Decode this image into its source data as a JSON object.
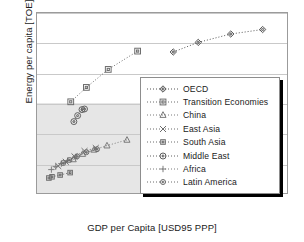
{
  "chart_data": {
    "type": "scatter",
    "title": "",
    "xlabel": "GDP per Capita [USD95 PPP]",
    "ylabel": "Energy per capita [TOE]",
    "xlim": [
      0,
      40000
    ],
    "ylim": [
      0,
      6
    ],
    "xticks": [
      0,
      10000,
      20000,
      30000,
      40000
    ],
    "xtick_labels": [
      "0",
      "10000",
      "20000",
      "30000",
      "40000"
    ],
    "yticks": [
      0,
      1,
      2,
      3,
      4,
      5,
      6
    ],
    "ytick_labels": [
      "0",
      "1",
      "2",
      "3",
      "4",
      "5",
      "6"
    ],
    "grid": "horizontal",
    "legend_position": "center-right-inside",
    "shaded_region": {
      "x": [
        0,
        16600
      ],
      "y": [
        0,
        3
      ]
    },
    "series": [
      {
        "name": "OECD",
        "marker": "diamond",
        "linestyle": "dotted",
        "color": "#555555",
        "points": [
          {
            "x": 21800,
            "y": 4.7
          },
          {
            "x": 25800,
            "y": 5.02
          },
          {
            "x": 31000,
            "y": 5.3
          },
          {
            "x": 36100,
            "y": 5.45
          }
        ]
      },
      {
        "name": "Transition Economies",
        "marker": "square",
        "linestyle": "dotted",
        "color": "#6d6d6d",
        "points": [
          {
            "x": 5400,
            "y": 3.04
          },
          {
            "x": 7900,
            "y": 3.52
          },
          {
            "x": 11400,
            "y": 4.12
          },
          {
            "x": 16100,
            "y": 4.73
          }
        ]
      },
      {
        "name": "China",
        "marker": "triangle",
        "linestyle": "dotted",
        "color": "#7a7a7a",
        "points": [
          {
            "x": 5800,
            "y": 1.12
          },
          {
            "x": 7300,
            "y": 1.3
          },
          {
            "x": 9100,
            "y": 1.44
          },
          {
            "x": 11200,
            "y": 1.58
          },
          {
            "x": 14400,
            "y": 1.77
          }
        ]
      },
      {
        "name": "East Asia",
        "marker": "x",
        "linestyle": "dotted",
        "color": "#6b6b6b",
        "points": [
          {
            "x": 3400,
            "y": 0.9
          },
          {
            "x": 4600,
            "y": 1.04
          },
          {
            "x": 6000,
            "y": 1.22
          },
          {
            "x": 7600,
            "y": 1.4
          },
          {
            "x": 9400,
            "y": 1.5
          }
        ]
      },
      {
        "name": "South Asia",
        "marker": "square-small",
        "linestyle": "dotted",
        "color": "#6d6d6d",
        "points": [
          {
            "x": 1900,
            "y": 0.5
          },
          {
            "x": 2400,
            "y": 0.54
          },
          {
            "x": 3700,
            "y": 0.6
          },
          {
            "x": 5300,
            "y": 0.68
          }
        ]
      },
      {
        "name": "Middle East",
        "marker": "circle",
        "linestyle": "dotted",
        "color": "#5f5f5f",
        "points": [
          {
            "x": 5900,
            "y": 2.38
          },
          {
            "x": 6500,
            "y": 2.58
          },
          {
            "x": 7200,
            "y": 2.78
          },
          {
            "x": 7600,
            "y": 2.8
          }
        ]
      },
      {
        "name": "Africa",
        "marker": "plus",
        "linestyle": "dotted",
        "color": "#7d7d7d",
        "points": [
          {
            "x": 2300,
            "y": 0.78
          },
          {
            "x": 3000,
            "y": 0.88
          },
          {
            "x": 3900,
            "y": 0.98
          },
          {
            "x": 4900,
            "y": 1.08
          },
          {
            "x": 6200,
            "y": 1.2
          }
        ]
      },
      {
        "name": "Latin America",
        "marker": "circle-small",
        "linestyle": "dotted",
        "color": "#6a6a6a",
        "points": [
          {
            "x": 4200,
            "y": 1.0
          },
          {
            "x": 5200,
            "y": 1.1
          },
          {
            "x": 6400,
            "y": 1.22
          },
          {
            "x": 7900,
            "y": 1.36
          },
          {
            "x": 9600,
            "y": 1.46
          }
        ]
      }
    ]
  },
  "legend": {
    "items": [
      {
        "label": "OECD"
      },
      {
        "label": "Transition Economies"
      },
      {
        "label": "China"
      },
      {
        "label": "East Asia"
      },
      {
        "label": "South Asia"
      },
      {
        "label": "Middle East"
      },
      {
        "label": "Africa"
      },
      {
        "label": "Latin America"
      }
    ]
  }
}
